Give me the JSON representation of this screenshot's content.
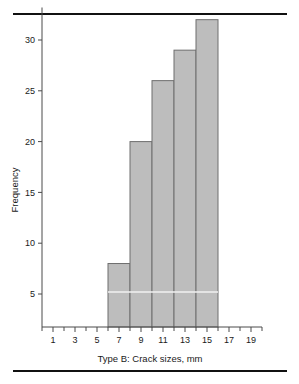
{
  "figure": {
    "has_top_rule": true,
    "has_bottom_rule": true,
    "rule_color": "#111111",
    "background": "#ffffff"
  },
  "chart_data": {
    "type": "bar",
    "title": "",
    "subtitle": "",
    "xlabel": "Type B: Crack sizes, mm",
    "ylabel": "Frequency",
    "categories": [
      "6-8",
      "8-10",
      "10-12",
      "12-14",
      "14-16"
    ],
    "bin_edges": [
      6,
      8,
      10,
      12,
      14,
      16
    ],
    "values": [
      8,
      20,
      26,
      29,
      32
    ],
    "x": [
      7,
      9,
      11,
      13,
      15
    ],
    "xlim": [
      0,
      20
    ],
    "ylim": [
      0,
      34
    ],
    "xticks": [
      1,
      3,
      5,
      7,
      9,
      11,
      13,
      15,
      17,
      19
    ],
    "xticklabels": [
      "1",
      "3",
      "5",
      "7",
      "9",
      "11",
      "13",
      "15",
      "17",
      "19"
    ],
    "xminorticks": [
      0,
      2,
      4,
      6,
      8,
      10,
      12,
      14,
      16,
      18,
      20
    ],
    "yticks": [
      5,
      10,
      15,
      20,
      25,
      30
    ],
    "yticklabels": [
      "5",
      "10",
      "15",
      "20",
      "25",
      "30"
    ],
    "grid": false,
    "legend": null,
    "bar_fill": "#bdbdbd",
    "bar_edge": "#6e6e6e",
    "axis_color": "#4a4a4a",
    "annotations": [
      {
        "name": "white-guide-line",
        "y": 5.2,
        "color": "#f2f2f2"
      }
    ]
  }
}
